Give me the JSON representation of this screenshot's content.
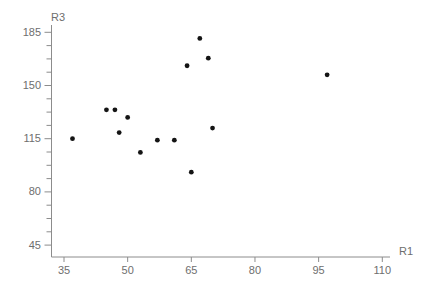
{
  "chart_data": {
    "type": "scatter",
    "title": "",
    "xlabel": "R1",
    "ylabel": "R3",
    "x_ticks": [
      35,
      50,
      65,
      80,
      95,
      110
    ],
    "y_ticks": [
      45,
      80,
      115,
      150,
      185
    ],
    "y_minor_divisions": 4,
    "xlim": [
      32,
      111
    ],
    "ylim": [
      37,
      189
    ],
    "grid": false,
    "legend": "none",
    "points": [
      {
        "x": 37,
        "y": 115
      },
      {
        "x": 45,
        "y": 134
      },
      {
        "x": 47,
        "y": 134
      },
      {
        "x": 48,
        "y": 119
      },
      {
        "x": 50,
        "y": 129
      },
      {
        "x": 53,
        "y": 106
      },
      {
        "x": 57,
        "y": 114
      },
      {
        "x": 61,
        "y": 114
      },
      {
        "x": 64,
        "y": 163
      },
      {
        "x": 65,
        "y": 93
      },
      {
        "x": 67,
        "y": 181
      },
      {
        "x": 69,
        "y": 168
      },
      {
        "x": 70,
        "y": 122
      },
      {
        "x": 97,
        "y": 157
      }
    ],
    "colors": {
      "point": "#141414",
      "axis": "#8c8c8c",
      "text": "#6e6e6e",
      "background": "#ffffff"
    }
  }
}
